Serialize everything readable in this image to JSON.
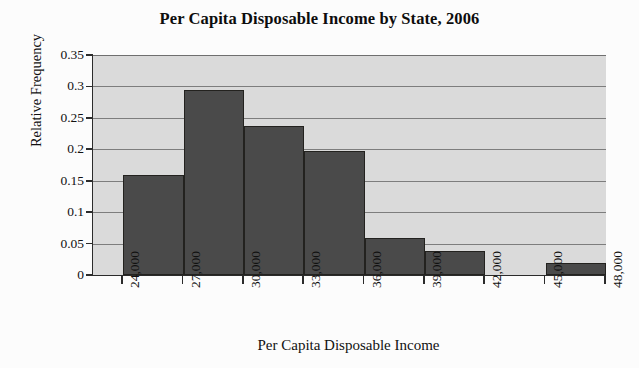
{
  "chart_data": {
    "type": "bar",
    "title": "Per Capita Disposable Income by State, 2006",
    "xlabel": "Per Capita Disposable Income",
    "ylabel": "Relative Frequency",
    "grid": true,
    "legend": "none",
    "xlim": [
      22500,
      48000
    ],
    "ylim": [
      0,
      0.35
    ],
    "x_tick_labels": [
      "24,000",
      "27,000",
      "30,000",
      "33,000",
      "36,000",
      "39,000",
      "42,000",
      "45,000",
      "48,000"
    ],
    "x_tick_values": [
      24000,
      27000,
      30000,
      33000,
      36000,
      39000,
      42000,
      45000,
      48000
    ],
    "y_tick_labels": [
      "0",
      "0.05",
      "0.1",
      "0.15",
      "0.2",
      "0.25",
      "0.3",
      "0.35"
    ],
    "y_tick_values": [
      0,
      0.05,
      0.1,
      0.15,
      0.2,
      0.25,
      0.3,
      0.35
    ],
    "bin_width": 3000,
    "bins": [
      {
        "label": "24,000-27,000",
        "start": 24000,
        "end": 27000,
        "value": 0.159
      },
      {
        "label": "27,000-30,000",
        "start": 27000,
        "end": 30000,
        "value": 0.295
      },
      {
        "label": "30,000-33,000",
        "start": 30000,
        "end": 33000,
        "value": 0.237
      },
      {
        "label": "33,000-36,000",
        "start": 33000,
        "end": 36000,
        "value": 0.197
      },
      {
        "label": "36,000-39,000",
        "start": 36000,
        "end": 39000,
        "value": 0.059
      },
      {
        "label": "39,000-42,000",
        "start": 39000,
        "end": 42000,
        "value": 0.039
      },
      {
        "label": "42,000-45,000",
        "start": 42000,
        "end": 45000,
        "value": 0.0
      },
      {
        "label": "45,000-48,000",
        "start": 45000,
        "end": 48000,
        "value": 0.019
      }
    ],
    "categories": [
      "24,000-27,000",
      "27,000-30,000",
      "30,000-33,000",
      "33,000-36,000",
      "36,000-39,000",
      "39,000-42,000",
      "42,000-45,000",
      "45,000-48,000"
    ],
    "values": [
      0.159,
      0.295,
      0.237,
      0.197,
      0.059,
      0.039,
      0.0,
      0.019
    ],
    "colors": {
      "bar_fill": "#4a4a4a",
      "bar_edge": "#23221f",
      "plot_background": "#dadada",
      "gridline": "#7d7d7d",
      "axis": "#2b2b2b",
      "text": "#111111",
      "page_background": "#fcfcfc"
    }
  }
}
